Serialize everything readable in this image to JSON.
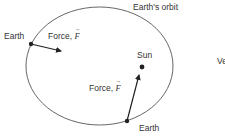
{
  "diagram": {
    "orbit_label": "Earth's orbit",
    "sun_label": "Sun",
    "earth_top_label": "Earth",
    "earth_bottom_label": "Earth",
    "force_top_label": "Force,",
    "force_bottom_label": "Force,",
    "force_symbol": "F",
    "cropped_text": "Ve"
  },
  "colors": {
    "stroke": "#333333",
    "text": "#333333",
    "background": "#ffffff"
  }
}
